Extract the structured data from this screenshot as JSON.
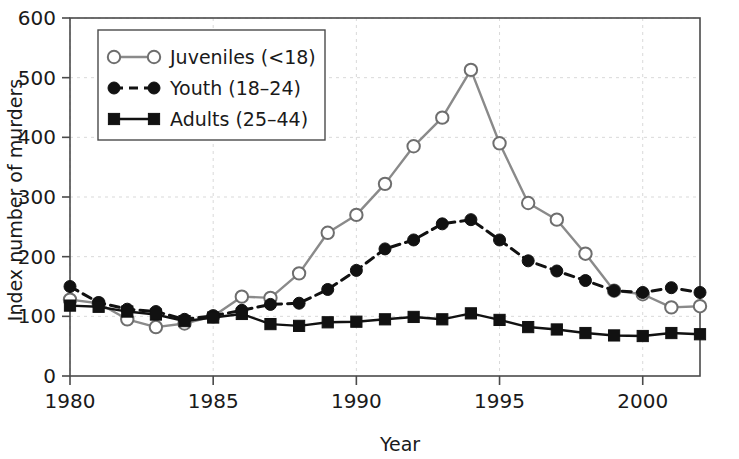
{
  "chart_data": {
    "type": "line",
    "title": "",
    "xlabel": "Year",
    "ylabel": "Index number of murders",
    "xlim": [
      1980,
      2002
    ],
    "ylim": [
      0,
      600
    ],
    "xticks": [
      1980,
      1985,
      1990,
      1995,
      2000
    ],
    "xtick_labels": [
      "1980",
      "1985",
      "1990",
      "1995",
      "2000"
    ],
    "yticks": [
      0,
      100,
      200,
      300,
      400,
      500,
      600
    ],
    "ytick_labels": [
      "0",
      "100",
      "200",
      "300",
      "400",
      "500",
      "600"
    ],
    "grid": "dashed light gray horizontal and vertical",
    "legend_position": "upper left inside plot",
    "x": [
      1980,
      1981,
      1982,
      1983,
      1984,
      1985,
      1986,
      1987,
      1988,
      1989,
      1990,
      1991,
      1992,
      1993,
      1994,
      1995,
      1996,
      1997,
      1998,
      1999,
      2000,
      2001,
      2002
    ],
    "series": [
      {
        "name": "Juveniles (<18)",
        "marker": "open-circle",
        "linestyle": "solid",
        "color": "#8a8a8a",
        "marker_edge_color": "#6e6e6e",
        "marker_face_color": "#ffffff",
        "values": [
          128,
          122,
          95,
          82,
          88,
          100,
          133,
          131,
          172,
          240,
          270,
          322,
          385,
          433,
          513,
          390,
          290,
          262,
          205,
          143,
          137,
          115,
          117
        ]
      },
      {
        "name": "Youth (18–24)",
        "marker": "filled-circle",
        "linestyle": "dashed",
        "color": "#111111",
        "marker_edge_color": "#111111",
        "marker_face_color": "#111111",
        "values": [
          150,
          123,
          112,
          108,
          95,
          101,
          110,
          120,
          122,
          145,
          177,
          213,
          228,
          255,
          262,
          228,
          193,
          176,
          160,
          143,
          140,
          148,
          140
        ]
      },
      {
        "name": "Adults (25–44)",
        "marker": "filled-square",
        "linestyle": "solid",
        "color": "#111111",
        "marker_edge_color": "#111111",
        "marker_face_color": "#111111",
        "values": [
          118,
          116,
          108,
          103,
          92,
          98,
          104,
          87,
          84,
          90,
          91,
          95,
          99,
          95,
          105,
          94,
          82,
          78,
          72,
          68,
          67,
          72,
          70
        ]
      }
    ]
  },
  "axes": {
    "x_title": "Year",
    "y_title": "Index number of murders"
  },
  "legend": {
    "items": [
      {
        "label": "Juveniles (<18)"
      },
      {
        "label": "Youth (18–24)"
      },
      {
        "label": "Adults (25–44)"
      }
    ]
  },
  "colors": {
    "juveniles_line": "#8a8a8a",
    "youth_line": "#111111",
    "adults_line": "#111111",
    "axis": "#4a4a4a",
    "grid": "#d9d9d9",
    "text": "#1a1a1a",
    "background": "#ffffff"
  }
}
